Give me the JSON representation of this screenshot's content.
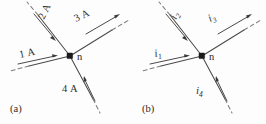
{
  "figure": {
    "node_label_a": "n",
    "node_label_b": "n",
    "caption_a": "(a)",
    "caption_b": "(b)",
    "ink_color": "#4a4a4a",
    "dash_color": "#7d7d7d",
    "text_color": "#2e2e2e",
    "background": "#fdfdfd"
  },
  "panel_a": {
    "id": "a",
    "caption": "(a)",
    "node": "n",
    "branches": [
      {
        "name": "branch-1",
        "label": "1 A",
        "direction": "into-node",
        "position": "lower-left",
        "angle_deg": -14
      },
      {
        "name": "branch-2",
        "label": "2 A",
        "direction": "into-node",
        "position": "upper-left",
        "angle_deg": -64
      },
      {
        "name": "branch-3",
        "label": "3 A",
        "direction": "out-of-node",
        "position": "upper-right",
        "angle_deg": -26
      },
      {
        "name": "branch-4",
        "label": "4 A",
        "direction": "out-of-node",
        "position": "lower-right",
        "angle_deg": 64
      }
    ]
  },
  "panel_b": {
    "id": "b",
    "caption": "(b)",
    "node": "n",
    "branches": [
      {
        "name": "branch-1",
        "label": "i",
        "subscript": "1",
        "direction": "into-node",
        "position": "lower-left",
        "angle_deg": -14
      },
      {
        "name": "branch-2",
        "label": "i",
        "subscript": "2",
        "direction": "into-node",
        "position": "upper-left",
        "angle_deg": -64
      },
      {
        "name": "branch-3",
        "label": "i",
        "subscript": "3",
        "direction": "out-of-node",
        "position": "upper-right",
        "angle_deg": -26
      },
      {
        "name": "branch-4",
        "label": "i",
        "subscript": "4",
        "direction": "out-of-node",
        "position": "lower-right",
        "angle_deg": 64
      }
    ]
  }
}
